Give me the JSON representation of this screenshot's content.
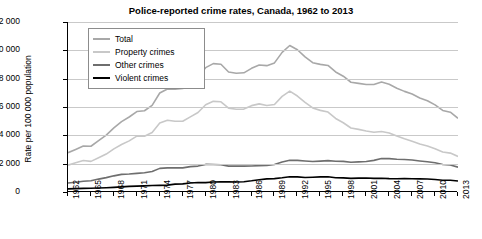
{
  "chart_data": {
    "type": "line",
    "title": "Police-reported crime rates, Canada, 1962 to 2013",
    "xlabel": "",
    "ylabel": "Rate per 100 000 population",
    "ylim": [
      0,
      12000
    ],
    "yticks": [
      0,
      2000,
      4000,
      6000,
      8000,
      10000,
      12000
    ],
    "ytick_labels": [
      "0",
      "2 000",
      "4 000",
      "6 000",
      "8 000",
      "10 000",
      "12 000"
    ],
    "grid": true,
    "legend_position": "top-left",
    "x": [
      1962,
      1963,
      1964,
      1965,
      1966,
      1967,
      1968,
      1969,
      1970,
      1971,
      1972,
      1973,
      1974,
      1975,
      1976,
      1977,
      1978,
      1979,
      1980,
      1981,
      1982,
      1983,
      1984,
      1985,
      1986,
      1987,
      1988,
      1989,
      1990,
      1991,
      1992,
      1993,
      1994,
      1995,
      1996,
      1997,
      1998,
      1999,
      2000,
      2001,
      2002,
      2003,
      2004,
      2005,
      2006,
      2007,
      2008,
      2009,
      2010,
      2011,
      2012,
      2013
    ],
    "xtick_labels": [
      "1962",
      "1965",
      "1968",
      "1971",
      "1974",
      "1977",
      "1980",
      "1983",
      "1986",
      "1989",
      "1992",
      "1995",
      "1998",
      "2001",
      "2004",
      "2007",
      "2010",
      "2013"
    ],
    "series": [
      {
        "name": "Total",
        "color": "#a8a8a8",
        "values": [
          2771,
          3007,
          3245,
          3229,
          3627,
          4013,
          4526,
          4971,
          5293,
          5679,
          5735,
          6114,
          6988,
          7268,
          7258,
          7302,
          7744,
          8127,
          8778,
          9062,
          9020,
          8470,
          8387,
          8413,
          8729,
          8960,
          8919,
          9113,
          9857,
          10342,
          10040,
          9538,
          9130,
          9007,
          8931,
          8472,
          8175,
          7747,
          7666,
          7590,
          7589,
          7761,
          7601,
          7325,
          7103,
          6917,
          6630,
          6438,
          6147,
          5757,
          5632,
          5206
        ]
      },
      {
        "name": "Property crimes",
        "color": "#c8c8c8",
        "values": [
          1891,
          2068,
          2219,
          2160,
          2419,
          2679,
          3047,
          3354,
          3608,
          3949,
          3933,
          4197,
          4865,
          5069,
          4989,
          4992,
          5307,
          5616,
          6162,
          6399,
          6369,
          5921,
          5842,
          5853,
          6095,
          6220,
          6109,
          6179,
          6753,
          7125,
          6775,
          6321,
          5935,
          5762,
          5642,
          5190,
          4886,
          4517,
          4418,
          4310,
          4222,
          4273,
          4169,
          3954,
          3761,
          3588,
          3390,
          3250,
          3048,
          2824,
          2746,
          2511
        ]
      },
      {
        "name": "Other crimes",
        "color": "#6e6e6e",
        "values": [
          636,
          684,
          763,
          795,
          911,
          1014,
          1141,
          1243,
          1269,
          1313,
          1358,
          1448,
          1668,
          1706,
          1705,
          1702,
          1794,
          1829,
          1947,
          1942,
          1919,
          1824,
          1828,
          1823,
          1836,
          1861,
          1874,
          1936,
          2121,
          2245,
          2234,
          2193,
          2148,
          2179,
          2212,
          2174,
          2160,
          2096,
          2124,
          2152,
          2232,
          2360,
          2353,
          2317,
          2299,
          2261,
          2192,
          2133,
          2059,
          1944,
          1912,
          1752
        ]
      },
      {
        "name": "Violent crimes",
        "color": "#000000",
        "values": [
          221,
          238,
          253,
          262,
          281,
          303,
          327,
          360,
          397,
          417,
          435,
          461,
          470,
          486,
          556,
          573,
          633,
          672,
          663,
          711,
          724,
          715,
          709,
          728,
          789,
          868,
          926,
          947,
          1001,
          1072,
          1070,
          1023,
          1046,
          1066,
          1076,
          1007,
          997,
          959,
          982,
          984,
          965,
          970,
          945,
          940,
          951,
          940,
          928,
          922,
          881,
          833,
          827,
          780
        ]
      }
    ]
  },
  "legend": {
    "items": [
      {
        "label": "Total"
      },
      {
        "label": "Property crimes"
      },
      {
        "label": "Other crimes"
      },
      {
        "label": "Violent crimes"
      }
    ]
  }
}
